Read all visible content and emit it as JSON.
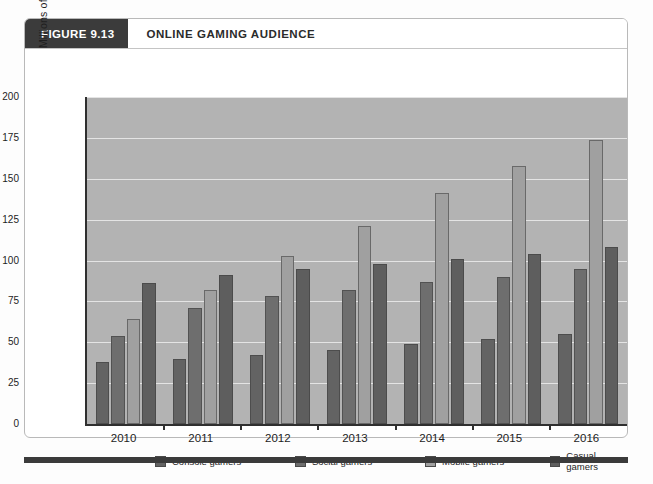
{
  "figure": {
    "tag": "FIGURE 9.13",
    "title": "ONLINE GAMING AUDIENCE"
  },
  "colors": {
    "tag_bg": "#3b3b3b",
    "plot_bg": "#b3b3b3",
    "gridline": "#e4e4e4",
    "axis": "#2f2f2f",
    "console": "#636363",
    "social": "#6e6e6e",
    "mobile": "#a0a0a0",
    "casual": "#5e5e5e"
  },
  "legend": [
    {
      "label": "Console gamers",
      "color": "#636363"
    },
    {
      "label": "Social gamers",
      "color": "#6e6e6e"
    },
    {
      "label": "Mobile gamers",
      "color": "#a0a0a0"
    },
    {
      "label": "Casual gamers",
      "color": "#5e5e5e"
    }
  ],
  "yticks": [
    "200",
    "175",
    "150",
    "125",
    "100",
    "75",
    "50",
    "25",
    "0"
  ],
  "chart_data": {
    "type": "bar",
    "title": "ONLINE GAMING AUDIENCE",
    "xlabel": "",
    "ylabel": "Millions of gamers",
    "ylim": [
      0,
      200
    ],
    "ytick_step": 25,
    "grid": true,
    "legend_position": "bottom",
    "categories": [
      "2010",
      "2011",
      "2012",
      "2013",
      "2014",
      "2015",
      "2016"
    ],
    "series": [
      {
        "name": "Console gamers",
        "color": "#636363",
        "values": [
          38,
          40,
          42,
          45,
          49,
          52,
          55
        ]
      },
      {
        "name": "Social gamers",
        "color": "#6e6e6e",
        "values": [
          54,
          71,
          78,
          82,
          87,
          90,
          95
        ]
      },
      {
        "name": "Mobile gamers",
        "color": "#a0a0a0",
        "values": [
          64,
          82,
          103,
          121,
          141,
          158,
          174
        ]
      },
      {
        "name": "Casual gamers",
        "color": "#5e5e5e",
        "values": [
          86,
          91,
          95,
          98,
          101,
          104,
          108
        ]
      }
    ]
  }
}
